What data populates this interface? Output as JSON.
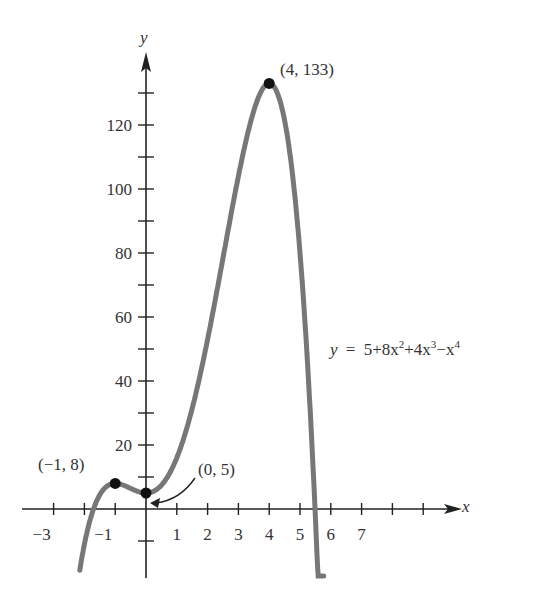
{
  "chart_data": {
    "type": "line",
    "title": "",
    "xlabel": "x",
    "ylabel": "y",
    "equation": "y = 5+8x^2+4x^3-x^4",
    "equation_parts": {
      "lhs": "y",
      "eq": "=",
      "rhs_a": "5+8x",
      "exp2": "2",
      "rhs_b": "+4x",
      "exp3": "3",
      "rhs_c": "−x",
      "exp4": "4"
    },
    "xlim": [
      -4,
      10
    ],
    "ylim": [
      -25,
      140
    ],
    "x_ticks": [
      -3,
      -2,
      -1,
      0,
      1,
      2,
      3,
      4,
      5,
      6,
      7,
      8,
      9
    ],
    "x_tick_labels": [
      "−3",
      "−1",
      "1",
      "2",
      "3",
      "4",
      "5",
      "6",
      "7"
    ],
    "y_ticks": [
      -10,
      10,
      20,
      30,
      40,
      50,
      60,
      70,
      80,
      90,
      100,
      110,
      120,
      130
    ],
    "y_tick_labels": [
      "20",
      "40",
      "60",
      "80",
      "100",
      "120"
    ],
    "grid": false,
    "series": [
      {
        "name": "y = 5+8x^2+4x^3-x^4",
        "color": "#777777",
        "x": [
          -1.6,
          -1.5,
          -1.25,
          -1,
          -0.5,
          0,
          0.5,
          1,
          1.5,
          2,
          2.5,
          3,
          3.5,
          4,
          4.5,
          5,
          5.5,
          5.75
        ],
        "values": [
          -12.6,
          -5.3,
          4.5,
          8,
          5.9,
          5,
          7.4,
          16,
          30.4,
          53,
          82.7,
          104,
          125.1,
          133,
          113.4,
          80,
          2.0,
          -52
        ]
      }
    ],
    "annotations": [
      {
        "text": "(4, 133)",
        "x": 4,
        "y": 133
      },
      {
        "text": "(−1, 8)",
        "x": -1,
        "y": 8
      },
      {
        "text": "(0, 5)",
        "x": 0,
        "y": 5,
        "arrow": true
      }
    ]
  },
  "labels": {
    "y_axis": "y",
    "x_axis": "x",
    "pt_max": "(4, 133)",
    "pt_left": "(−1, 8)",
    "pt_int": "(0, 5)"
  }
}
